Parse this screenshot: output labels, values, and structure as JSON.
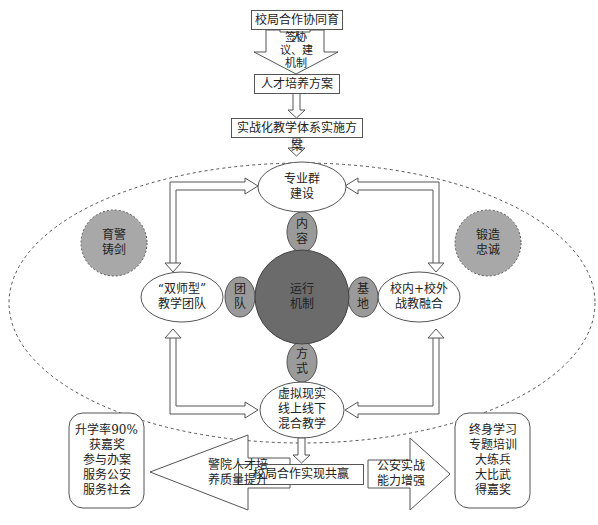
{
  "top": {
    "box1": "校局合作协同育人",
    "arrow1_label": "签协\n议、建\n机制",
    "box2": "人才培养方案",
    "box3": "实战化教学体系实施方案"
  },
  "nodes": {
    "top_ellipse": "专业群\n建设",
    "left_ellipse": "“双师型”\n教学团队",
    "right_ellipse": "校内+校外\n战教融合",
    "bottom_ellipse": "虚拟现实\n线上线下\n混合教学",
    "center": "运行\n机制",
    "petal_top": "内\n容",
    "petal_left": "团\n队",
    "petal_right": "基\n地",
    "petal_bottom": "方\n式",
    "left_circle": "育警\n铸剑",
    "right_circle": "锻造\n忠诚"
  },
  "bottom": {
    "center_box": "校局合作实现共赢",
    "left_arrow": "警院人才培\n养质量提升",
    "right_arrow": "公安实战\n能力增强",
    "left_result": "升学率90%\n获嘉奖\n参与办案\n服务公安\n服务社会",
    "right_result": "终身学习\n专题培训\n大练兵\n大比武\n得嘉奖"
  },
  "colors": {
    "center_fill": "#6b6b6b",
    "petal_fill": "#9a9a9a",
    "side_circle_fill": "#a8a8a8",
    "line": "#555555"
  }
}
